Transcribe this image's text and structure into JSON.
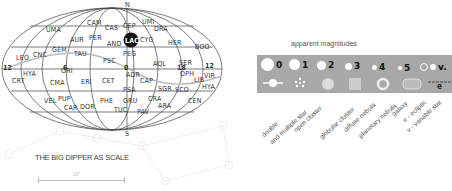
{
  "sky_map": {
    "north_label": "N",
    "south_label": "S",
    "highlight_constellation": "LAC",
    "hour_labels": [
      {
        "text": "12",
        "x": 6,
        "y": 71
      },
      {
        "text": "6",
        "x": 66,
        "y": 71
      },
      {
        "text": "0",
        "x": 127,
        "y": 71
      },
      {
        "text": "18",
        "x": 180,
        "y": 71
      },
      {
        "text": "12",
        "x": 208,
        "y": 69
      }
    ],
    "constellations": [
      {
        "text": "UMA",
        "x": 54,
        "y": 32
      },
      {
        "text": "CAM",
        "x": 95,
        "y": 25
      },
      {
        "text": "CAS",
        "x": 113,
        "y": 30
      },
      {
        "text": "CEP",
        "x": 131,
        "y": 28
      },
      {
        "text": "UMI",
        "x": 150,
        "y": 24
      },
      {
        "text": "DRA",
        "x": 162,
        "y": 31
      },
      {
        "text": "AUR",
        "x": 78,
        "y": 42
      },
      {
        "text": "PER",
        "x": 97,
        "y": 40
      },
      {
        "text": "AND",
        "x": 115,
        "y": 46
      },
      {
        "text": "CYG",
        "x": 148,
        "y": 42
      },
      {
        "text": "HER",
        "x": 176,
        "y": 45
      },
      {
        "text": "BOO",
        "x": 203,
        "y": 49
      },
      {
        "text": "GEM",
        "x": 60,
        "y": 52
      },
      {
        "text": "LEO",
        "x": 24,
        "y": 60
      },
      {
        "text": "CNC",
        "x": 41,
        "y": 57
      },
      {
        "text": "TAU",
        "x": 82,
        "y": 56
      },
      {
        "text": "PEG",
        "x": 131,
        "y": 56
      },
      {
        "text": "PSC",
        "x": 111,
        "y": 63
      },
      {
        "text": "AQL",
        "x": 161,
        "y": 66
      },
      {
        "text": "SER",
        "x": 187,
        "y": 65
      },
      {
        "text": "HYA",
        "x": 31,
        "y": 76
      },
      {
        "text": "ORI",
        "x": 69,
        "y": 73
      },
      {
        "text": "ADR",
        "x": 134,
        "y": 77
      },
      {
        "text": "OPH",
        "x": 188,
        "y": 76
      },
      {
        "text": "VIR",
        "x": 212,
        "y": 78
      },
      {
        "text": "CRT",
        "x": 20,
        "y": 83
      },
      {
        "text": "CMA",
        "x": 58,
        "y": 85
      },
      {
        "text": "ERI",
        "x": 89,
        "y": 84
      },
      {
        "text": "CET",
        "x": 110,
        "y": 83
      },
      {
        "text": "CAP",
        "x": 148,
        "y": 83
      },
      {
        "text": "LIB",
        "x": 202,
        "y": 82
      },
      {
        "text": "HYA",
        "x": 210,
        "y": 89
      },
      {
        "text": "PSA",
        "x": 131,
        "y": 92
      },
      {
        "text": "SGR",
        "x": 166,
        "y": 91
      },
      {
        "text": "SCO",
        "x": 183,
        "y": 92
      },
      {
        "text": "VEL",
        "x": 52,
        "y": 103
      },
      {
        "text": "PUP",
        "x": 66,
        "y": 101
      },
      {
        "text": "PHE",
        "x": 108,
        "y": 103
      },
      {
        "text": "GRU",
        "x": 131,
        "y": 103
      },
      {
        "text": "CRA",
        "x": 156,
        "y": 101
      },
      {
        "text": "CEN",
        "x": 196,
        "y": 103
      },
      {
        "text": "ARA",
        "x": 166,
        "y": 108
      },
      {
        "text": "CAR",
        "x": 72,
        "y": 110
      },
      {
        "text": "DOR",
        "x": 88,
        "y": 109
      },
      {
        "text": "TUC",
        "x": 122,
        "y": 112
      },
      {
        "text": "PAV",
        "x": 145,
        "y": 114
      }
    ]
  },
  "legend": {
    "header": "apparent magnitudes",
    "magnitudes": [
      {
        "label": "0",
        "size": 13,
        "x": 4
      },
      {
        "label": "1",
        "size": 11,
        "x": 32
      },
      {
        "label": "2",
        "size": 9,
        "x": 60
      },
      {
        "label": "3",
        "size": 7,
        "x": 88
      },
      {
        "label": "4",
        "size": 5,
        "x": 115
      },
      {
        "label": "5",
        "size": 4,
        "x": 141
      },
      {
        "label": "v.",
        "size": 6,
        "x": 163
      }
    ],
    "symbol_labels": [
      {
        "text": "double",
        "x": 260,
        "y": 133
      },
      {
        "text": "and multiple star",
        "x": 268,
        "y": 140
      },
      {
        "text": "open cluster",
        "x": 292,
        "y": 128
      },
      {
        "text": "globular cluster",
        "x": 318,
        "y": 135
      },
      {
        "text": "diffuse nebula",
        "x": 342,
        "y": 128
      },
      {
        "text": "planetary nebula",
        "x": 357,
        "y": 134
      },
      {
        "text": "galaxy",
        "x": 390,
        "y": 112
      },
      {
        "text": "e - ecliptic",
        "x": 401,
        "y": 118
      },
      {
        "text": "v - variable star",
        "x": 405,
        "y": 128
      }
    ],
    "ecliptic_symbol": "e"
  },
  "scale": {
    "title": "THE BIG DIPPER AS SCALE",
    "degrees_label": "10°"
  },
  "colors": {
    "legend_bg": "#a8a8a8",
    "highlight_fill": "#111111",
    "ecliptic_line": "#bbbbbb",
    "grid_line": "#444444"
  }
}
